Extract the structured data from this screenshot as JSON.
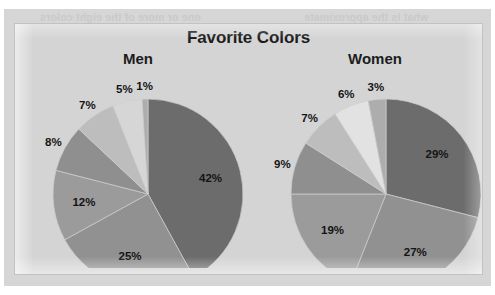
{
  "page": {
    "background_color": "#d4d4d4",
    "paper_color": "#d6d6d6",
    "frame_border_color": "#c2c2c2"
  },
  "ghost_text": {
    "line1_left": "one or more of the eight colors",
    "line1_right": "what is the approximate",
    "line2_left": "Which is approximately",
    "line2_right": "were the same"
  },
  "chart_data": [
    {
      "type": "pie",
      "title": "Favorite Colors",
      "subtitle": "Men",
      "panel": "men",
      "categories": [
        "Color 1",
        "Color 2",
        "Color 3",
        "Color 4",
        "Color 5",
        "Color 6",
        "Color 7"
      ],
      "values": [
        42,
        25,
        12,
        8,
        7,
        5,
        1
      ],
      "labels": [
        "42%",
        "25%",
        "12%",
        "8%",
        "7%",
        "5%",
        "1%"
      ],
      "colors": [
        "#6c6c6c",
        "#919191",
        "#9b9b9b",
        "#8f8f8f",
        "#bdbdbd",
        "#d6d6d6",
        "#adadad"
      ],
      "start_angle_deg": 0,
      "direction": "clockwise",
      "legend": "none",
      "grid": false,
      "total": 100
    },
    {
      "type": "pie",
      "title": "Favorite Colors",
      "subtitle": "Women",
      "panel": "women",
      "categories": [
        "Color 1",
        "Color 2",
        "Color 3",
        "Color 4",
        "Color 5",
        "Color 6",
        "Color 7"
      ],
      "values": [
        29,
        27,
        19,
        9,
        7,
        6,
        3
      ],
      "labels": [
        "29%",
        "27%",
        "19%",
        "9%",
        "7%",
        "6%",
        "3%"
      ],
      "colors": [
        "#6c6c6c",
        "#919191",
        "#9b9b9b",
        "#8f8f8f",
        "#bdbdbd",
        "#e2e2e2",
        "#adadad"
      ],
      "start_angle_deg": 0,
      "direction": "clockwise",
      "legend": "none",
      "grid": false,
      "total": 100
    }
  ],
  "title": "Favorite Colors",
  "panels": {
    "men": {
      "label": "Men"
    },
    "women": {
      "label": "Women"
    }
  }
}
